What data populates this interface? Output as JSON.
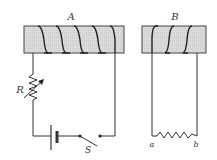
{
  "diagram": {
    "type": "electromagnetic-induction-circuit",
    "coil_a": {
      "label": "A",
      "turns": 5
    },
    "coil_b": {
      "label": "B",
      "turns": 3
    },
    "variable_resistor": {
      "label": "R"
    },
    "switch": {
      "label": "S",
      "state": "open"
    },
    "battery": {
      "label": ""
    },
    "load_resistor": {
      "terminal_left": "a",
      "terminal_right": "b"
    },
    "colors": {
      "core_fill": "#d9d9d9",
      "wire": "#333333"
    }
  }
}
